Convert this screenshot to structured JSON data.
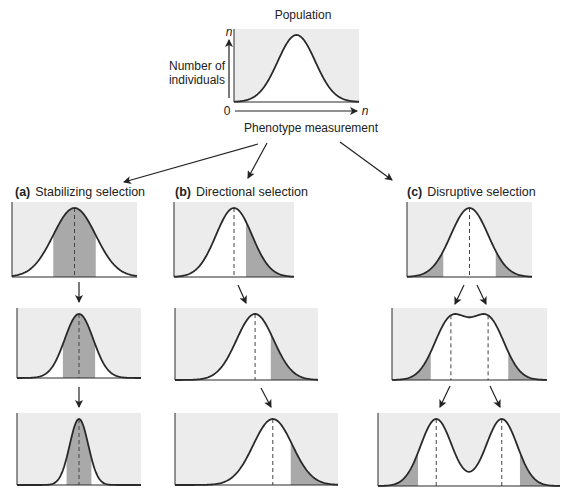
{
  "colors": {
    "panel_bg": "#ececec",
    "under_curve": "#ffffff",
    "shaded": "#a9a9a9",
    "line": "#2a2a2a",
    "text": "#222222"
  },
  "population": {
    "title": "Population",
    "y_label_line1": "Number of",
    "y_label_line2": "individuals",
    "y_axis_symbol": "n",
    "x_axis_symbol": "n",
    "origin": "0",
    "x_label": "Phenotype measurement"
  },
  "columns": [
    {
      "letter": "(a)",
      "title": "Stabilizing selection",
      "type": "stabilizing",
      "panels": [
        {
          "x": 12,
          "y": 202,
          "w": 125,
          "h": 75,
          "peaks": [
            {
              "mu": 0.5,
              "sd": 0.17,
              "a": 1
            }
          ],
          "shade": "middle",
          "shade_range": [
            0.33,
            0.67
          ],
          "dashed": [
            0.5
          ]
        },
        {
          "x": 17,
          "y": 308,
          "w": 124,
          "h": 70,
          "peaks": [
            {
              "mu": 0.5,
              "sd": 0.115,
              "a": 1
            }
          ],
          "shade": "middle",
          "shade_range": [
            0.37,
            0.63
          ],
          "dashed": [
            0.5
          ]
        },
        {
          "x": 17,
          "y": 413,
          "w": 124,
          "h": 72,
          "peaks": [
            {
              "mu": 0.5,
              "sd": 0.075,
              "a": 1
            }
          ],
          "shade": "middle",
          "shade_range": [
            0.4,
            0.6
          ],
          "dashed": [
            0.5
          ]
        }
      ]
    },
    {
      "letter": "(b)",
      "title": "Directional selection",
      "type": "directional",
      "panels": [
        {
          "x": 174,
          "y": 202,
          "w": 120,
          "h": 75,
          "peaks": [
            {
              "mu": 0.5,
              "sd": 0.15,
              "a": 1
            }
          ],
          "shade": "right",
          "shade_range": [
            0.6,
            1.0
          ],
          "dashed": [
            0.5
          ]
        },
        {
          "x": 175,
          "y": 308,
          "w": 143,
          "h": 72,
          "peaks": [
            {
              "mu": 0.56,
              "sd": 0.13,
              "a": 1
            }
          ],
          "shade": "right",
          "shade_range": [
            0.67,
            1.0
          ],
          "dashed": [
            0.56
          ]
        },
        {
          "x": 175,
          "y": 413,
          "w": 163,
          "h": 72,
          "peaks": [
            {
              "mu": 0.6,
              "sd": 0.12,
              "a": 1
            }
          ],
          "shade": "right",
          "shade_range": [
            0.71,
            1.0
          ],
          "dashed": [
            0.6
          ]
        }
      ]
    },
    {
      "letter": "(c)",
      "title": "Disruptive selection",
      "type": "disruptive",
      "panels": [
        {
          "x": 407,
          "y": 202,
          "w": 125,
          "h": 75,
          "peaks": [
            {
              "mu": 0.5,
              "sd": 0.15,
              "a": 1
            }
          ],
          "shade": "tails",
          "shade_range": [
            0.29,
            0.71
          ],
          "dashed": [
            0.5
          ]
        },
        {
          "x": 392,
          "y": 308,
          "w": 155,
          "h": 72,
          "peaks": [
            {
              "mu": 0.38,
              "sd": 0.105,
              "a": 1
            },
            {
              "mu": 0.62,
              "sd": 0.105,
              "a": 1
            }
          ],
          "shade": "tails",
          "shade_range": [
            0.25,
            0.75
          ],
          "dashed": [
            0.38,
            0.62
          ]
        },
        {
          "x": 378,
          "y": 413,
          "w": 182,
          "h": 73,
          "peaks": [
            {
              "mu": 0.32,
              "sd": 0.085,
              "a": 1
            },
            {
              "mu": 0.68,
              "sd": 0.085,
              "a": 1
            }
          ],
          "shade": "tails",
          "shade_range": [
            0.22,
            0.78
          ],
          "dashed": [
            0.32,
            0.68
          ]
        }
      ]
    }
  ]
}
